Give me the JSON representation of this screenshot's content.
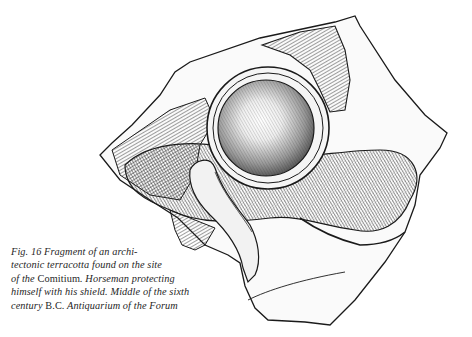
{
  "figure": {
    "label": "Fig. 16",
    "ink_color": "#1a1a1a",
    "paper_color": "#ffffff"
  },
  "caption": {
    "lines": [
      {
        "parts": [
          "Fig. 16   Fragment of an archi-"
        ]
      },
      {
        "parts": [
          "tectonic terracotta found on the site"
        ]
      },
      {
        "parts": [
          "of the ",
          "Comitium",
          ". Horseman protecting"
        ]
      },
      {
        "parts": [
          "himself with his shield. Middle of the sixth"
        ]
      },
      {
        "parts": [
          "century  ",
          "B.C.",
          "  Antiquarium  of  the  Forum"
        ]
      }
    ]
  }
}
